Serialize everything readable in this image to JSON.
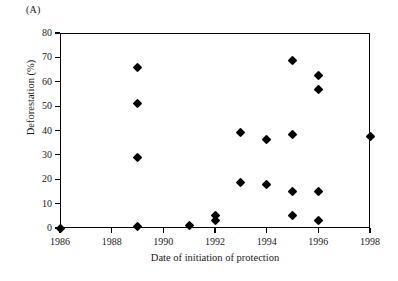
{
  "panel_label": "(A)",
  "chart_data": {
    "type": "scatter",
    "title": "",
    "xlabel": "Date of initiation of protection",
    "ylabel": "Deforestation (%)",
    "xlim": [
      1986,
      1998
    ],
    "ylim": [
      0,
      80
    ],
    "xticks": [
      1986,
      1988,
      1990,
      1992,
      1994,
      1996,
      1998
    ],
    "xtick_labels": [
      "1986",
      "1988",
      "1990",
      "1992",
      "1994",
      "1996",
      "1998"
    ],
    "yticks": [
      0,
      10,
      20,
      30,
      40,
      50,
      60,
      70,
      80
    ],
    "ytick_labels": [
      "0",
      "10",
      "20",
      "30",
      "40",
      "50",
      "60",
      "70",
      "80"
    ],
    "grid": false,
    "legend": false,
    "marker": "diamond",
    "marker_color": "#000000",
    "points": [
      {
        "x": 1986,
        "y": 0
      },
      {
        "x": 1989,
        "y": 65.8
      },
      {
        "x": 1989,
        "y": 51.2
      },
      {
        "x": 1989,
        "y": 28.9
      },
      {
        "x": 1989,
        "y": 0.8
      },
      {
        "x": 1991,
        "y": 1.0
      },
      {
        "x": 1992,
        "y": 5.0
      },
      {
        "x": 1992,
        "y": 3.0
      },
      {
        "x": 1993,
        "y": 39.0
      },
      {
        "x": 1993,
        "y": 18.7
      },
      {
        "x": 1994,
        "y": 36.4
      },
      {
        "x": 1994,
        "y": 17.9
      },
      {
        "x": 1995,
        "y": 68.7
      },
      {
        "x": 1995,
        "y": 38.5
      },
      {
        "x": 1995,
        "y": 15.1
      },
      {
        "x": 1995,
        "y": 5.0
      },
      {
        "x": 1996,
        "y": 62.6
      },
      {
        "x": 1996,
        "y": 56.7
      },
      {
        "x": 1996,
        "y": 15.1
      },
      {
        "x": 1996,
        "y": 3.1
      },
      {
        "x": 1998,
        "y": 37.5
      }
    ]
  }
}
